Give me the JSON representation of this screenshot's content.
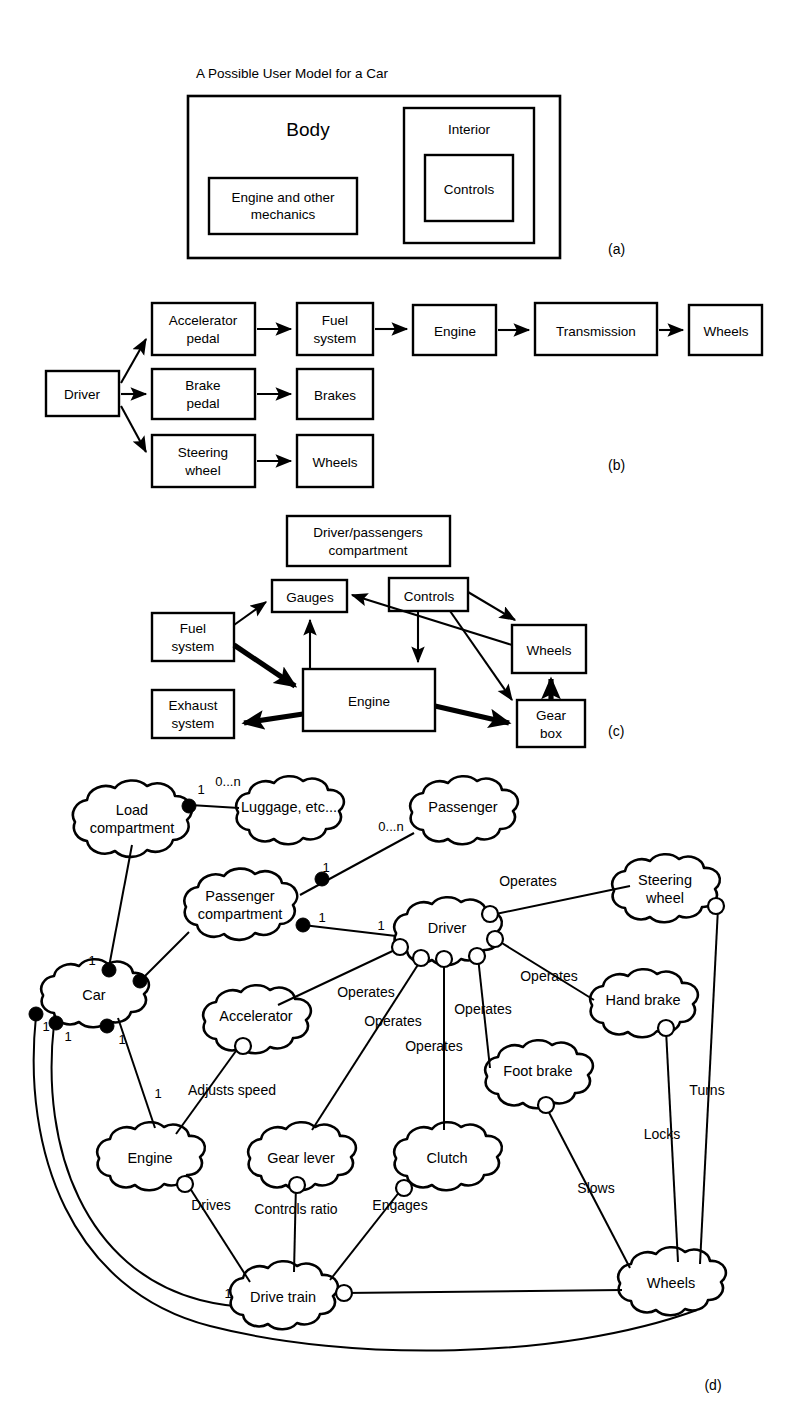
{
  "figure": {
    "panels": [
      {
        "id": "a",
        "letter": "(a)",
        "title": "A Possible User Model for a Car"
      },
      {
        "id": "b",
        "letter": "(b)",
        "title": ""
      },
      {
        "id": "c",
        "letter": "(c)",
        "title": ""
      },
      {
        "id": "d",
        "letter": "(d)",
        "title": ""
      }
    ]
  },
  "panel_a": {
    "title": "A Possible User Model for a Car",
    "letter": "(a)",
    "boxes": {
      "body": "Body",
      "engine": "Engine and other\nmechanics",
      "engine_line1": "Engine and other",
      "engine_line2": "mechanics",
      "interior": "Interior",
      "controls": "Controls"
    }
  },
  "panel_b": {
    "letter": "(b)",
    "nodes": {
      "driver": "Driver",
      "accelerator_pedal_l1": "Accelerator",
      "accelerator_pedal_l2": "pedal",
      "brake_pedal_l1": "Brake",
      "brake_pedal_l2": "pedal",
      "steering_wheel_l1": "Steering",
      "steering_wheel_l2": "wheel",
      "fuel_system_l1": "Fuel",
      "fuel_system_l2": "system",
      "brakes": "Brakes",
      "wheels_bottom": "Wheels",
      "engine": "Engine",
      "transmission": "Transmission",
      "wheels_right": "Wheels"
    },
    "edges": [
      {
        "from": "Driver",
        "to": "Accelerator pedal"
      },
      {
        "from": "Driver",
        "to": "Brake pedal"
      },
      {
        "from": "Driver",
        "to": "Steering wheel"
      },
      {
        "from": "Accelerator pedal",
        "to": "Fuel system"
      },
      {
        "from": "Brake pedal",
        "to": "Brakes"
      },
      {
        "from": "Steering wheel",
        "to": "Wheels"
      },
      {
        "from": "Fuel system",
        "to": "Engine"
      },
      {
        "from": "Engine",
        "to": "Transmission"
      },
      {
        "from": "Transmission",
        "to": "Wheels"
      }
    ]
  },
  "panel_c": {
    "letter": "(c)",
    "nodes": {
      "compartment_l1": "Driver/passengers",
      "compartment_l2": "compartment",
      "gauges": "Gauges",
      "controls": "Controls",
      "fuel_system_l1": "Fuel",
      "fuel_system_l2": "system",
      "exhaust_system_l1": "Exhaust",
      "exhaust_system_l2": "system",
      "engine": "Engine",
      "wheels": "Wheels",
      "gear_box_l1": "Gear",
      "gear_box_l2": "box"
    },
    "edges": [
      {
        "from": "Fuel system",
        "to": "Gauges",
        "weight": "thin"
      },
      {
        "from": "Fuel system",
        "to": "Engine",
        "weight": "thick"
      },
      {
        "from": "Engine",
        "to": "Gauges",
        "weight": "thin"
      },
      {
        "from": "Engine",
        "to": "Exhaust system",
        "weight": "thick"
      },
      {
        "from": "Engine",
        "to": "Gear box",
        "weight": "thick"
      },
      {
        "from": "Controls",
        "to": "Engine",
        "weight": "thin"
      },
      {
        "from": "Controls",
        "to": "Wheels",
        "weight": "thin"
      },
      {
        "from": "Controls",
        "to": "Gear box",
        "weight": "thin"
      },
      {
        "from": "Wheels",
        "to": "Gauges",
        "weight": "thin"
      },
      {
        "from": "Gear box",
        "to": "Wheels",
        "weight": "thick"
      }
    ]
  },
  "panel_d": {
    "letter": "(d)",
    "clouds": {
      "load_compartment_l1": "Load",
      "load_compartment_l2": "compartment",
      "luggage": "Luggage, etc...",
      "passenger": "Passenger",
      "passenger_compartment_l1": "Passenger",
      "passenger_compartment_l2": "compartment",
      "car": "Car",
      "driver": "Driver",
      "steering_wheel_l1": "Steering",
      "steering_wheel_l2": "wheel",
      "hand_brake": "Hand brake",
      "foot_brake": "Foot brake",
      "accelerator": "Accelerator",
      "clutch": "Clutch",
      "gear_lever": "Gear lever",
      "engine": "Engine",
      "drive_train": "Drive train",
      "wheels": "Wheels"
    },
    "edge_labels": {
      "operates_steering": "Operates",
      "operates_hand_brake": "Operates",
      "operates_foot_brake": "Operates",
      "operates_clutch": "Operates",
      "operates_gear_lever": "Operates",
      "operates_accelerator": "Operates",
      "adjusts_speed": "Adjusts speed",
      "drives": "Drives",
      "controls_ratio": "Controls ratio",
      "engages": "Engages",
      "slows": "Slows",
      "locks": "Locks",
      "turns": "Turns"
    },
    "multiplicities": {
      "load_to_luggage_near": "1",
      "load_to_luggage_far": "0...n",
      "passenger_comp_to_passenger_far": "0...n",
      "passenger_comp_to_passenger_near": "1",
      "passenger_comp_to_driver": "1",
      "driver_side": "1",
      "car_to_load": "1",
      "car_left_a": "1",
      "car_left_b": "1",
      "car_bottom": "1",
      "engine_top": "1",
      "drive_train_left": "1"
    }
  }
}
